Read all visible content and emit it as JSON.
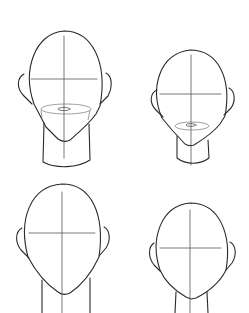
{
  "image": {
    "description": "Four head construction sketches (front view) with crosshair guidelines",
    "background": "#ffffff",
    "line_color": "#2a2a2a"
  },
  "sketches": [
    {
      "name": "head-large-with-jaw-guide",
      "position": "top-left"
    },
    {
      "name": "head-small-with-jaw-guide",
      "position": "top-right"
    },
    {
      "name": "head-large-plain",
      "position": "bottom-left"
    },
    {
      "name": "head-small-plain",
      "position": "bottom-right"
    }
  ]
}
